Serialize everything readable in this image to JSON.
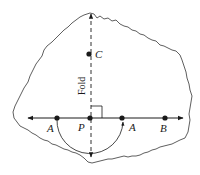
{
  "diagram": {
    "fold_label": "Fold",
    "points": {
      "A_left": {
        "label": "A",
        "x": 57,
        "y": 118
      },
      "P": {
        "label": "P",
        "x": 90,
        "y": 118
      },
      "A_right": {
        "label": "A",
        "x": 122,
        "y": 118
      },
      "B": {
        "label": "B",
        "x": 165,
        "y": 118
      },
      "C": {
        "label": "C",
        "x": 89,
        "y": 54
      }
    },
    "colors": {
      "stroke": "#1a1a1a",
      "background": "#ffffff"
    }
  }
}
